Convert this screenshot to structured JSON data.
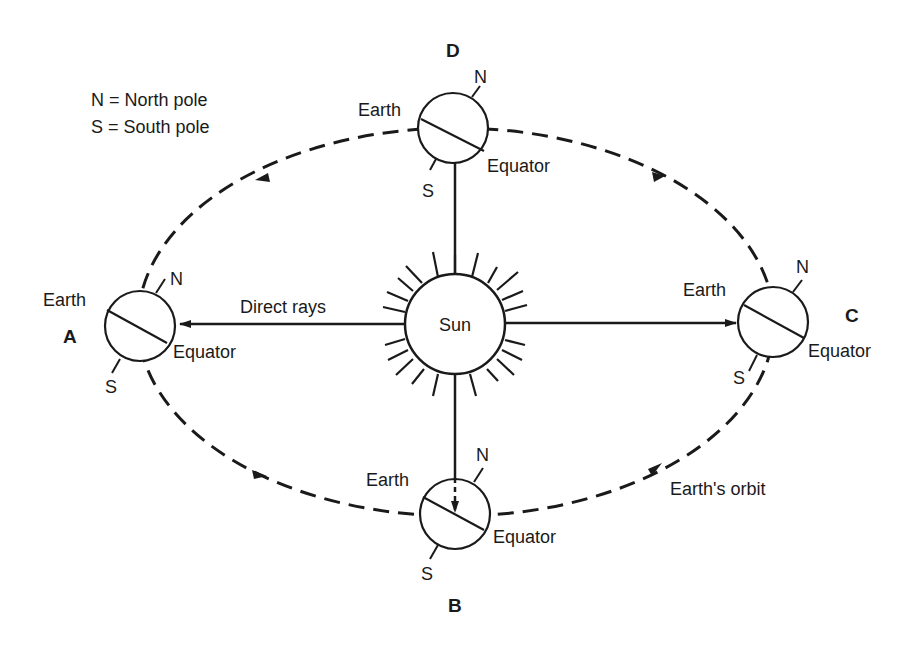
{
  "legend": {
    "line1": "N = North pole",
    "line2": "S = South pole"
  },
  "sun": {
    "label": "Sun"
  },
  "rays_label": "Direct rays",
  "orbit_label": "Earth's orbit",
  "positions": [
    {
      "id": "A",
      "earth_label": "Earth",
      "north": "N",
      "south": "S",
      "equator": "Equator"
    },
    {
      "id": "B",
      "earth_label": "Earth",
      "north": "N",
      "south": "S",
      "equator": "Equator"
    },
    {
      "id": "C",
      "earth_label": "Earth",
      "north": "N",
      "south": "S",
      "equator": "Equator"
    },
    {
      "id": "D",
      "earth_label": "Earth",
      "north": "N",
      "south": "S",
      "equator": "Equator"
    }
  ],
  "colors": {
    "ink": "#1a1a1a",
    "background": "#ffffff"
  }
}
